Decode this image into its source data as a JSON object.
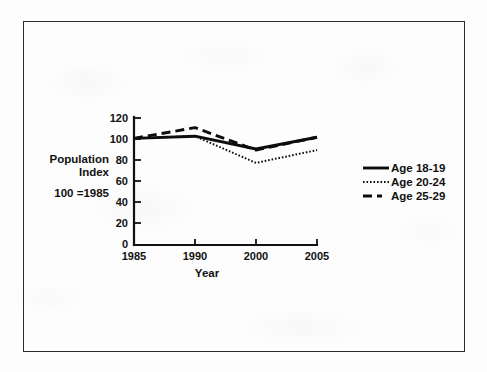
{
  "figure": {
    "has_border_frame": true,
    "background_color": "#fdfdfd",
    "ink_color": "#0d0d0d"
  },
  "axis": {
    "x_title": "Year",
    "y_label_line1": "Population",
    "y_label_line2": "Index",
    "y_label_line3": "100 =1985",
    "x_tick_labels": [
      "1985",
      "1990",
      "2000",
      "2005"
    ],
    "y_tick_labels": [
      "0",
      "20",
      "40",
      "60",
      "80",
      "100",
      "120"
    ]
  },
  "legend": {
    "items": [
      {
        "label": "Age 18-19",
        "style": "solid"
      },
      {
        "label": "Age 20-24",
        "style": "dotted"
      },
      {
        "label": "Age 25-29",
        "style": "dashed"
      }
    ]
  },
  "chart_data": {
    "type": "line",
    "title": "",
    "xlabel": "Year",
    "ylabel": "Population Index, 100 =1985",
    "categories": [
      "1985",
      "1990",
      "2000",
      "2005"
    ],
    "x_scale": "categorical",
    "ylim": [
      0,
      120
    ],
    "y_ticks": [
      0,
      20,
      40,
      60,
      80,
      100,
      120
    ],
    "grid": false,
    "legend_position": "right",
    "series": [
      {
        "name": "Age 18-19",
        "style": "solid",
        "values": [
          100,
          102,
          90,
          101
        ]
      },
      {
        "name": "Age 20-24",
        "style": "dotted",
        "values": [
          100,
          102,
          77,
          89
        ]
      },
      {
        "name": "Age 25-29",
        "style": "dashed",
        "values": [
          100,
          110,
          89,
          101
        ]
      }
    ]
  }
}
